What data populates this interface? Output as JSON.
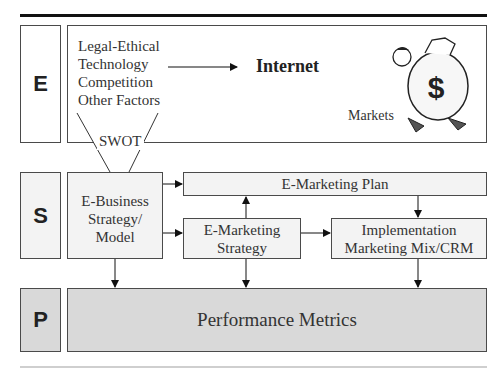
{
  "rows": {
    "environment": {
      "letter": "E"
    },
    "strategy": {
      "letter": "S"
    },
    "performance": {
      "letter": "P"
    }
  },
  "environment": {
    "factors": [
      "Legal-Ethical",
      "Technology",
      "Competition",
      "Other Factors"
    ],
    "internet_label": "Internet",
    "markets_label": "Markets",
    "swot_label": "SWOT",
    "money_bag_symbol": "$"
  },
  "strategy": {
    "ebusiness_lines": [
      "E-Business",
      "Strategy/",
      "Model"
    ],
    "plan_label": "E-Marketing Plan",
    "emarketing_strategy_lines": [
      "E-Marketing",
      "Strategy"
    ],
    "implementation_lines": [
      "Implementation",
      "Marketing Mix/CRM"
    ]
  },
  "performance": {
    "metrics_label": "Performance Metrics"
  },
  "colors": {
    "box_light": "#f3f3f3",
    "box_gray": "#d9d9d9",
    "border": "#4a4a4a",
    "rule": "#111111"
  }
}
